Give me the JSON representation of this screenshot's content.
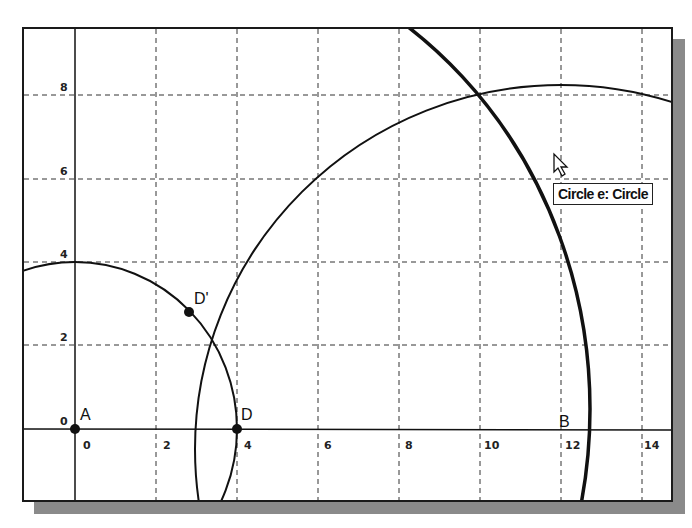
{
  "graphics_view": {
    "x_axis": {
      "ticks": [
        0,
        2,
        4,
        6,
        8,
        10,
        12,
        14
      ]
    },
    "y_axis": {
      "ticks": [
        2,
        4,
        6,
        8
      ],
      "origin_label": "0"
    },
    "points": [
      {
        "name": "A",
        "label": "A",
        "x": 0,
        "y": 0
      },
      {
        "name": "D",
        "label": "D",
        "x": 4,
        "y": 0
      },
      {
        "name": "D'",
        "label": "D'",
        "x": 2.8,
        "y": 2.8
      },
      {
        "name": "B",
        "label": "B",
        "x": 12,
        "y": 0
      }
    ],
    "objects": [
      {
        "name": "circle-A",
        "description": "Circle centered at A through D",
        "center": [
          0,
          0
        ],
        "radius": 4
      },
      {
        "name": "circle-large",
        "description": "Large circle centered near B",
        "center": [
          12,
          0
        ],
        "radius": 9
      },
      {
        "name": "circle-e",
        "description": "Thick circle e (highlighted)",
        "center": [
          3.5,
          0
        ],
        "radius": 10
      }
    ],
    "tooltip": {
      "text": "Circle e: Circle"
    }
  }
}
